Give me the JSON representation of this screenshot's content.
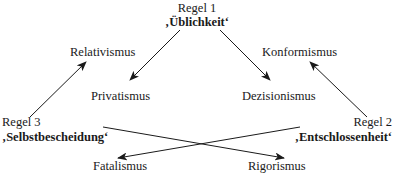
{
  "diagram": {
    "rules": [
      {
        "id": "regel1",
        "label": "Regel 1",
        "name": "‚Üblichkeit‘"
      },
      {
        "id": "regel2",
        "label": "Regel 2",
        "name": "‚Entschlossenheit‘"
      },
      {
        "id": "regel3",
        "label": "Regel 3",
        "name": "‚Selbstbescheidung‘"
      }
    ],
    "nodes": {
      "relativismus": "Relativismus",
      "konformismus": "Konformismus",
      "privatismus": "Privatismus",
      "dezisionismus": "Dezisionismus",
      "fatalismus": "Fatalismus",
      "rigorismus": "Rigorismus"
    },
    "edges": [
      {
        "from": "Regel 1",
        "to": "Privatismus"
      },
      {
        "from": "Regel 1",
        "to": "Dezisionismus"
      },
      {
        "from": "Regel 3",
        "to": "Relativismus"
      },
      {
        "from": "Regel 2",
        "to": "Konformismus"
      },
      {
        "from": "Regel 3",
        "to": "Rigorismus"
      },
      {
        "from": "Regel 2",
        "to": "Fatalismus"
      }
    ],
    "colors": {
      "line": "#1a1a1a",
      "background": "#ffffff"
    }
  }
}
